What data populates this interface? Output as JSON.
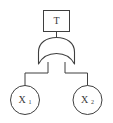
{
  "diagram": {
    "type": "fault-tree",
    "background_color": "#ffffff",
    "stroke_color": "#3f3f3f",
    "text_color": "#3a3a3a",
    "top_event": {
      "label": "T",
      "shape": "rectangle"
    },
    "gate": {
      "kind": "or-gate",
      "label": ""
    },
    "basic_events": [
      {
        "label": "X",
        "subscript": "1",
        "shape": "circle"
      },
      {
        "label": "X",
        "subscript": "2",
        "shape": "circle"
      }
    ],
    "edges": [
      {
        "from": "T",
        "to": "or-gate"
      },
      {
        "from": "or-gate",
        "to": "X1"
      },
      {
        "from": "or-gate",
        "to": "X2"
      }
    ]
  }
}
